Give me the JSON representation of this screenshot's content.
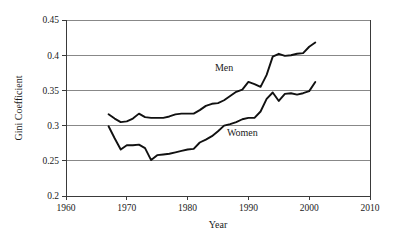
{
  "chart_data": {
    "type": "line",
    "title": "",
    "xlabel": "Year",
    "ylabel": "Gini Coefficient",
    "xlim": [
      1960,
      2010
    ],
    "ylim": [
      0.2,
      0.45
    ],
    "xticks": [
      1960,
      1970,
      1980,
      1990,
      2000,
      2010
    ],
    "xticklabels": [
      "1960",
      "1970",
      "1980",
      "1990",
      "2000",
      "2010"
    ],
    "yticks": [
      0.2,
      0.25,
      0.3,
      0.35,
      0.4,
      0.45
    ],
    "yticklabels": [
      "0.2",
      "0.25",
      "0.3",
      "0.35",
      "0.4",
      "0.45"
    ],
    "grid": "horizontal",
    "legend": "inline-annotations",
    "line_color": "#111111",
    "series": [
      {
        "name": "Men",
        "label": "Men",
        "label_x": 1986,
        "label_y": 0.378,
        "x": [
          1967,
          1968,
          1969,
          1970,
          1971,
          1972,
          1973,
          1974,
          1975,
          1976,
          1977,
          1978,
          1979,
          1980,
          1981,
          1982,
          1983,
          1984,
          1985,
          1986,
          1987,
          1988,
          1989,
          1990,
          1991,
          1992,
          1993,
          1994,
          1995,
          1996,
          1997,
          1998,
          1999,
          2000,
          2001
        ],
        "values": [
          0.316,
          0.31,
          0.305,
          0.306,
          0.31,
          0.317,
          0.312,
          0.311,
          0.311,
          0.311,
          0.313,
          0.316,
          0.317,
          0.317,
          0.317,
          0.322,
          0.328,
          0.331,
          0.332,
          0.336,
          0.342,
          0.348,
          0.351,
          0.362,
          0.359,
          0.355,
          0.372,
          0.398,
          0.402,
          0.399,
          0.4,
          0.402,
          0.403,
          0.412,
          0.418
        ]
      },
      {
        "name": "Women",
        "label": "Women",
        "label_x": 1989,
        "label_y": 0.285,
        "x": [
          1967,
          1968,
          1969,
          1970,
          1971,
          1972,
          1973,
          1974,
          1975,
          1976,
          1977,
          1978,
          1979,
          1980,
          1981,
          1982,
          1983,
          1984,
          1985,
          1986,
          1987,
          1988,
          1989,
          1990,
          1991,
          1992,
          1993,
          1994,
          1995,
          1996,
          1997,
          1998,
          1999,
          2000,
          2001
        ],
        "values": [
          0.299,
          0.282,
          0.266,
          0.272,
          0.272,
          0.273,
          0.268,
          0.251,
          0.258,
          0.259,
          0.26,
          0.262,
          0.264,
          0.266,
          0.267,
          0.276,
          0.28,
          0.285,
          0.292,
          0.3,
          0.302,
          0.305,
          0.309,
          0.311,
          0.311,
          0.32,
          0.338,
          0.347,
          0.335,
          0.345,
          0.346,
          0.344,
          0.346,
          0.349,
          0.362
        ]
      }
    ]
  }
}
